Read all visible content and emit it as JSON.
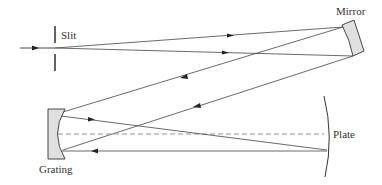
{
  "diagram": {
    "labels": {
      "slit": "Slit",
      "mirror": "Mirror",
      "grating": "Grating",
      "plate": "Plate"
    },
    "colors": {
      "line": "#333333",
      "component_fill": "#e0e0e0",
      "dashed_axis": "#888888",
      "background": "#ffffff"
    }
  }
}
